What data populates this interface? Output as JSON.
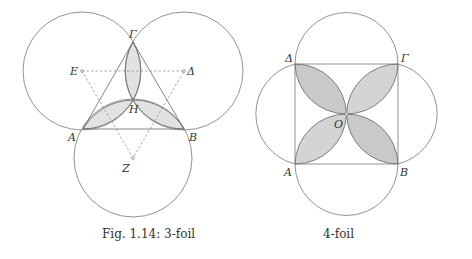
{
  "figures": [
    {
      "id": "3-foil",
      "caption": "Fig. 1.14: 3-foil",
      "labels": {
        "gamma": "Γ",
        "e": "E",
        "delta": "Δ",
        "eta": "H",
        "a": "A",
        "b": "B",
        "zeta": "Z"
      },
      "petal_color": "#e2e2e2"
    },
    {
      "id": "4-foil",
      "caption": "4-foil",
      "labels": {
        "delta": "Δ",
        "gamma": "Γ",
        "o": "O",
        "a": "A",
        "b": "B"
      },
      "petal_color": "#c9c9c9"
    }
  ],
  "colors": {
    "stroke": "#777777",
    "dashed": "#888888"
  }
}
